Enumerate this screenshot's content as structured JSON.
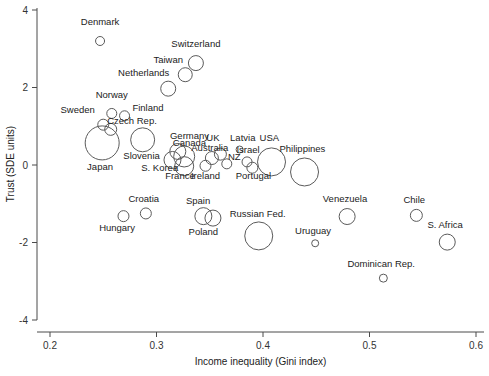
{
  "chart_data": {
    "type": "scatter",
    "title": "",
    "xlabel": "Income inequality (Gini index)",
    "ylabel": "Trust (SDE units)",
    "xlim": [
      0.18,
      0.605
    ],
    "ylim": [
      -4.35,
      4.3
    ],
    "xticks": [
      0.2,
      0.3,
      0.4,
      0.5,
      0.6
    ],
    "xticklabels": [
      "0.2",
      "0.3",
      "0.4",
      "0.5",
      "0.6"
    ],
    "yticks": [
      4,
      2,
      0,
      -2,
      -4
    ],
    "yticklabels": [
      "4",
      "2",
      "0",
      "-2",
      "-4"
    ],
    "grid": false,
    "legend": "none",
    "marker": "open-circle",
    "size_encodes": "population",
    "points": [
      {
        "label": "Denmark",
        "x": 0.247,
        "y": 3.2,
        "r": 4.5,
        "lx": 0.247,
        "ly": 3.62,
        "anchor": "middle"
      },
      {
        "label": "Switzerland",
        "x": 0.337,
        "y": 2.63,
        "r": 7.5,
        "lx": 0.337,
        "ly": 3.05,
        "anchor": "middle"
      },
      {
        "label": "Taiwan",
        "x": 0.327,
        "y": 2.33,
        "r": 7.0,
        "lx": 0.311,
        "ly": 2.62,
        "anchor": "middle"
      },
      {
        "label": "Netherlands",
        "x": 0.311,
        "y": 1.97,
        "r": 7.5,
        "lx": 0.288,
        "ly": 2.3,
        "anchor": "middle"
      },
      {
        "label": "Norway",
        "x": 0.258,
        "y": 1.33,
        "r": 5.0,
        "lx": 0.258,
        "ly": 1.72,
        "anchor": "middle"
      },
      {
        "label": "Finland",
        "x": 0.27,
        "y": 1.27,
        "r": 5.0,
        "lx": 0.292,
        "ly": 1.4,
        "anchor": "middle"
      },
      {
        "label": "Sweden",
        "x": 0.25,
        "y": 1.04,
        "r": 5.5,
        "lx": 0.226,
        "ly": 1.33,
        "anchor": "middle"
      },
      {
        "label": "Czech Rep.",
        "x": 0.257,
        "y": 0.92,
        "r": 6.0,
        "lx": 0.277,
        "ly": 1.07,
        "anchor": "middle"
      },
      {
        "label": "Japan",
        "x": 0.249,
        "y": 0.57,
        "r": 17.0,
        "lx": 0.247,
        "ly": -0.12,
        "anchor": "middle"
      },
      {
        "label": "Slovenia",
        "x": 0.287,
        "y": 0.65,
        "r": 12.0,
        "lx": 0.286,
        "ly": 0.16,
        "anchor": "middle"
      },
      {
        "label": "Germany",
        "x": 0.32,
        "y": 0.35,
        "r": 8.0,
        "lx": 0.331,
        "ly": 0.68,
        "anchor": "middle"
      },
      {
        "label": "Canada",
        "x": 0.326,
        "y": 0.22,
        "r": 10.5,
        "lx": 0.331,
        "ly": 0.5,
        "anchor": "middle"
      },
      {
        "label": "S. Korea",
        "x": 0.315,
        "y": 0.13,
        "r": 8.5,
        "lx": 0.303,
        "ly": -0.16,
        "anchor": "middle"
      },
      {
        "label": "France",
        "x": 0.326,
        "y": -0.03,
        "r": 9.5,
        "lx": 0.322,
        "ly": -0.36,
        "anchor": "middle"
      },
      {
        "label": "Australia",
        "x": 0.352,
        "y": 0.18,
        "r": 6.5,
        "lx": 0.35,
        "ly": 0.37,
        "anchor": "middle"
      },
      {
        "label": "UK",
        "x": 0.36,
        "y": 0.28,
        "r": 6.0,
        "lx": 0.353,
        "ly": 0.62,
        "anchor": "middle"
      },
      {
        "label": "NZ",
        "x": 0.366,
        "y": 0.03,
        "r": 5.0,
        "lx": 0.373,
        "ly": 0.14,
        "anchor": "middle"
      },
      {
        "label": "Ireland",
        "x": 0.346,
        "y": -0.02,
        "r": 5.5,
        "lx": 0.346,
        "ly": -0.35,
        "anchor": "middle"
      },
      {
        "label": "Latvia",
        "x": 0.378,
        "y": 0.4,
        "r": 3.5,
        "lx": 0.381,
        "ly": 0.62,
        "anchor": "middle"
      },
      {
        "label": "Israel",
        "x": 0.385,
        "y": 0.08,
        "r": 5.0,
        "lx": 0.386,
        "ly": 0.31,
        "anchor": "middle"
      },
      {
        "label": "Portugal",
        "x": 0.39,
        "y": -0.07,
        "r": 5.5,
        "lx": 0.391,
        "ly": -0.36,
        "anchor": "middle"
      },
      {
        "label": "USA",
        "x": 0.408,
        "y": 0.08,
        "r": 14.0,
        "lx": 0.406,
        "ly": 0.62,
        "anchor": "middle"
      },
      {
        "label": "Philippines",
        "x": 0.439,
        "y": -0.18,
        "r": 14.0,
        "lx": 0.437,
        "ly": 0.34,
        "anchor": "middle"
      },
      {
        "label": "Croatia",
        "x": 0.29,
        "y": -1.25,
        "r": 5.5,
        "lx": 0.288,
        "ly": -0.96,
        "anchor": "middle"
      },
      {
        "label": "Hungary",
        "x": 0.269,
        "y": -1.32,
        "r": 5.5,
        "lx": 0.263,
        "ly": -1.7,
        "anchor": "middle"
      },
      {
        "label": "Spain",
        "x": 0.344,
        "y": -1.32,
        "r": 8.5,
        "lx": 0.339,
        "ly": -1.0,
        "anchor": "middle"
      },
      {
        "label": "Poland",
        "x": 0.353,
        "y": -1.37,
        "r": 8.0,
        "lx": 0.344,
        "ly": -1.8,
        "anchor": "middle"
      },
      {
        "label": "Russian Fed.",
        "x": 0.396,
        "y": -1.83,
        "r": 14.0,
        "lx": 0.395,
        "ly": -1.33,
        "anchor": "middle"
      },
      {
        "label": "Uruguay",
        "x": 0.449,
        "y": -2.02,
        "r": 3.5,
        "lx": 0.447,
        "ly": -1.78,
        "anchor": "middle"
      },
      {
        "label": "Venezuela",
        "x": 0.479,
        "y": -1.33,
        "r": 8.0,
        "lx": 0.477,
        "ly": -0.95,
        "anchor": "middle"
      },
      {
        "label": "Chile",
        "x": 0.544,
        "y": -1.3,
        "r": 6.0,
        "lx": 0.542,
        "ly": -0.98,
        "anchor": "middle"
      },
      {
        "label": "S. Africa",
        "x": 0.573,
        "y": -1.99,
        "r": 8.0,
        "lx": 0.571,
        "ly": -1.62,
        "anchor": "middle"
      },
      {
        "label": "Dominican Rep.",
        "x": 0.513,
        "y": -2.92,
        "r": 4.0,
        "lx": 0.511,
        "ly": -2.63,
        "anchor": "middle"
      }
    ]
  }
}
